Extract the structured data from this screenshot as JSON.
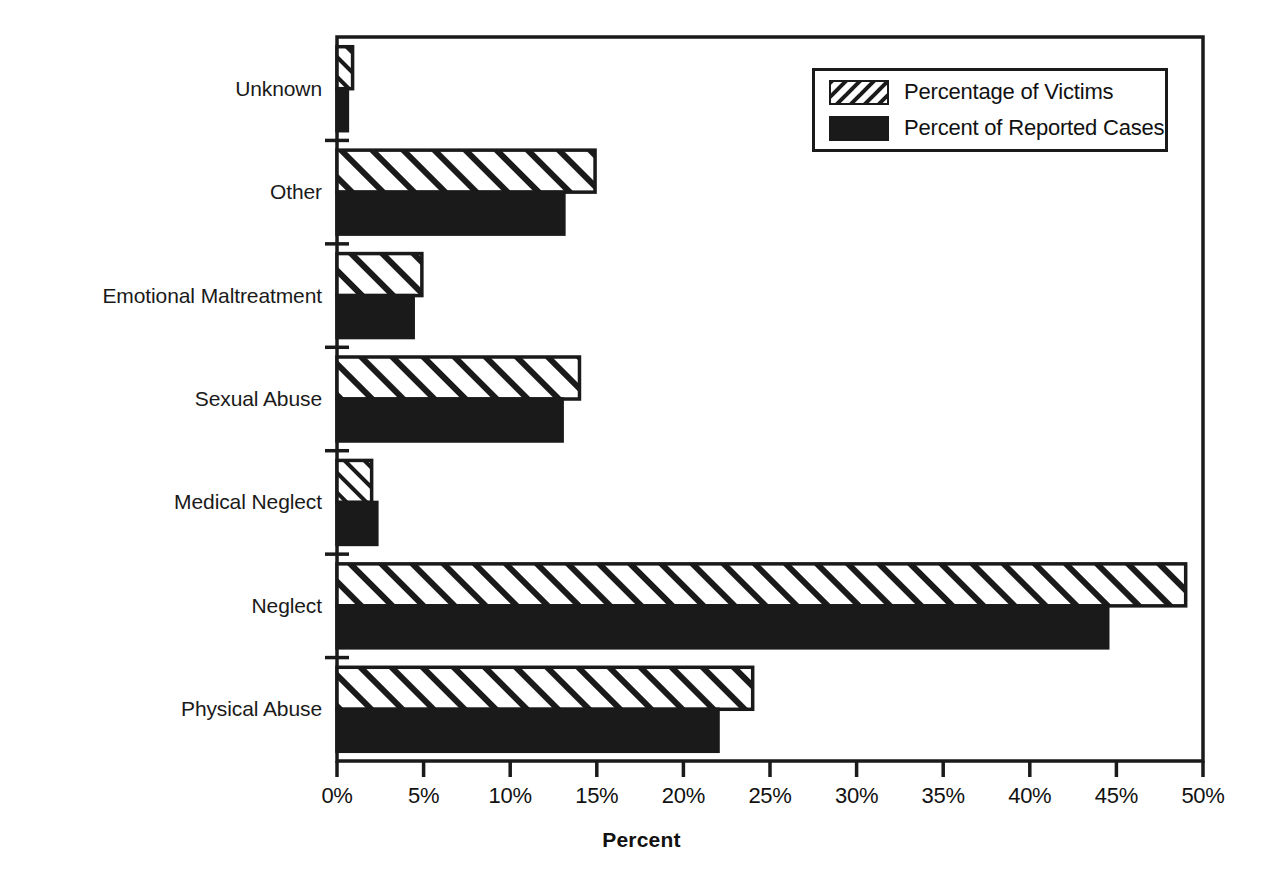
{
  "chart_data": {
    "type": "bar",
    "orientation": "horizontal",
    "title": "",
    "xlabel": "Percent",
    "ylabel": "",
    "xlim": [
      0,
      50
    ],
    "xticks": [
      0,
      5,
      10,
      15,
      20,
      25,
      30,
      35,
      40,
      45,
      50
    ],
    "xtick_labels": [
      "0%",
      "5%",
      "10%",
      "15%",
      "20%",
      "25%",
      "30%",
      "35%",
      "40%",
      "45%",
      "50%"
    ],
    "categories": [
      "Unknown",
      "Other",
      "Emotional Maltreatment",
      "Sexual Abuse",
      "Medical Neglect",
      "Neglect",
      "Physical Abuse"
    ],
    "series": [
      {
        "name": "Percentage of Victims",
        "fill": "hatched",
        "values": [
          0.9,
          14.9,
          4.9,
          14.0,
          2.0,
          49.0,
          24.0
        ]
      },
      {
        "name": "Percent of Reported Cases",
        "fill": "solid-black",
        "values": [
          0.6,
          13.1,
          4.4,
          13.0,
          2.3,
          44.5,
          22.0
        ]
      }
    ],
    "grid": false,
    "legend_position": "top-right",
    "colors": {
      "axis": "#1a1a1a",
      "hatch_fill": "#ffffff",
      "hatch_line": "#1a1a1a",
      "solid_fill": "#1a1a1a",
      "background": "#ffffff"
    }
  },
  "legend": {
    "items": [
      {
        "label": "Percentage of Victims",
        "swatch": "hatched-swatch"
      },
      {
        "label": "Percent of Reported Cases",
        "swatch": "solid-black-swatch"
      }
    ]
  },
  "axis": {
    "title": "Percent"
  }
}
